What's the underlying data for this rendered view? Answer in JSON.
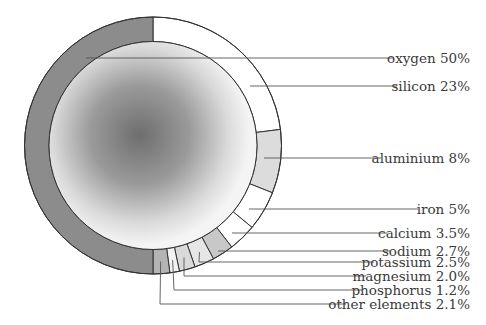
{
  "chart_data": {
    "type": "pie",
    "subtype": "annular ring (donut) with shaded core",
    "title": "",
    "start_angle_deg": 0,
    "direction": "clockwise from 12 o'clock",
    "categories": [
      "silicon",
      "aluminium",
      "iron",
      "calcium",
      "sodium",
      "potassium",
      "magnesium",
      "phosphorus",
      "other elements",
      "oxygen"
    ],
    "values": [
      23,
      8,
      5,
      3.5,
      2.7,
      2.5,
      2.0,
      1.2,
      2.1,
      50
    ],
    "unit": "%",
    "colors": [
      "#ffffff",
      "#dcdcdc",
      "#ffffff",
      "#ffffff",
      "#c8c8c8",
      "#e6e6e6",
      "#d9d9d9",
      "#f2f2f2",
      "#b4b4b4",
      "#8c8c8c"
    ],
    "labels": [
      {
        "name": "oxygen",
        "value": "50%",
        "text": "oxygen 50%",
        "y": 58,
        "line_x1": 86,
        "anchor_x": 394
      },
      {
        "name": "silicon",
        "value": "23%",
        "text": "silicon 23%",
        "y": 86,
        "line_x1": 250,
        "anchor_x": 397
      },
      {
        "name": "aluminium",
        "value": "8%",
        "text": "aluminium 8%",
        "y": 158,
        "line_x1": 264,
        "anchor_x": 381
      },
      {
        "name": "iron",
        "value": "5%",
        "text": "iron 5%",
        "y": 209,
        "line_x1": 249,
        "anchor_x": 418
      },
      {
        "name": "calcium",
        "value": "3.5%",
        "text": "calcium 3.5%",
        "y": 233,
        "line_x1": 232,
        "anchor_x": 387
      },
      {
        "name": "sodium",
        "value": "2.7%",
        "text": "sodium 2.7%",
        "y": 251,
        "line_x1": 218,
        "anchor_x": 390
      },
      {
        "name": "potassium",
        "value": "2.5%",
        "text": "potassium 2.5%",
        "y": 262,
        "line_x1": 199,
        "anchor_x": 374
      },
      {
        "name": "magnesium",
        "value": "2.0%",
        "text": "magnesium 2.0%",
        "y": 276,
        "line_x1": 184,
        "anchor_x": 366
      },
      {
        "name": "phosphorus",
        "value": "1.2%",
        "text": "phosphorus 1.2%",
        "y": 290,
        "line_x1": 174,
        "anchor_x": 362
      },
      {
        "name": "other elements",
        "value": "2.1%",
        "text": "other elements 2.1%",
        "y": 304,
        "line_x1": 160,
        "anchor_x": 346
      }
    ],
    "legend": "none (direct leader-line labels on right)",
    "grid": false
  },
  "geometry": {
    "cx": 153,
    "cy": 145.5,
    "outer_r": 128.5,
    "inner_r": 104,
    "core_gradient": {
      "center": [
        140,
        135
      ],
      "dark": "#6e6e6e",
      "light": "#f4f4f4"
    },
    "text_right_x": 470
  }
}
